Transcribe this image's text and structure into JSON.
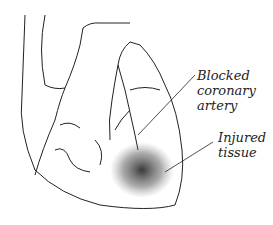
{
  "diagram": {
    "labels": [
      {
        "lines": [
          "Blocked",
          "coronary",
          "artery"
        ]
      },
      {
        "lines": [
          "Injured",
          "tissue"
        ]
      }
    ],
    "colors": {
      "stroke": "#222222",
      "background": "#ffffff",
      "shading": "#333333"
    }
  }
}
